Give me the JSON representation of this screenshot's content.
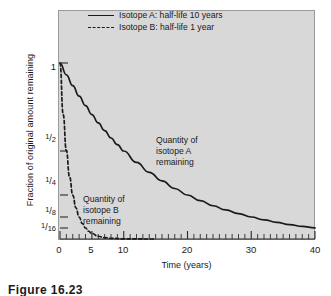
{
  "chart_data": {
    "type": "line",
    "title": "",
    "xlabel": "Time (years)",
    "ylabel": "Fraction of original amount remaining",
    "xlim": [
      0,
      40
    ],
    "ylim": [
      0,
      1
    ],
    "grid": false,
    "legend_position": "top-center",
    "x_ticks_major": [
      0,
      5,
      10,
      20,
      30,
      40
    ],
    "x_tick_labels": [
      "0",
      "5",
      "10",
      "20",
      "30",
      "40"
    ],
    "x_minor_tick_interval": 1,
    "y_ticks": [
      1,
      0.5,
      0.25,
      0.125,
      0.0625
    ],
    "y_tick_labels": [
      "1",
      "1/2",
      "1/4",
      "1/8",
      "1/16"
    ],
    "series": [
      {
        "name": "Isotope A: half-life 10 years",
        "style": "solid",
        "half_life_years": 10,
        "color": "#1a1a1a",
        "x": [
          0,
          1,
          2,
          3,
          4,
          5,
          6,
          7,
          8,
          9,
          10,
          12,
          14,
          16,
          18,
          20,
          22,
          24,
          26,
          28,
          30,
          32,
          34,
          36,
          38,
          40
        ],
        "values": [
          1.0,
          0.933,
          0.871,
          0.812,
          0.758,
          0.707,
          0.66,
          0.616,
          0.574,
          0.536,
          0.5,
          0.435,
          0.379,
          0.33,
          0.287,
          0.25,
          0.218,
          0.189,
          0.165,
          0.144,
          0.125,
          0.109,
          0.095,
          0.082,
          0.072,
          0.063
        ]
      },
      {
        "name": "Isotope B: half-life 1 year",
        "style": "dashed",
        "half_life_years": 1,
        "color": "#1a1a1a",
        "x": [
          0,
          0.5,
          1,
          1.5,
          2,
          2.5,
          3,
          3.5,
          4,
          4.5,
          5,
          6,
          7,
          8,
          10,
          12,
          14,
          15
        ],
        "values": [
          1.0,
          0.707,
          0.5,
          0.354,
          0.25,
          0.177,
          0.125,
          0.088,
          0.0625,
          0.044,
          0.031,
          0.0156,
          0.0078,
          0.0039,
          0.001,
          0.00024,
          6e-05,
          3e-05
        ]
      }
    ],
    "annotations": [
      {
        "text_lines": [
          "Quantity of",
          "isotope A",
          "remaining"
        ],
        "x": 17,
        "y": 0.47
      },
      {
        "text_lines": [
          "Quantity of",
          "isotope B",
          "remaining"
        ],
        "x": 5.5,
        "y": 0.23
      }
    ]
  },
  "legend": {
    "items": [
      {
        "label": "Isotope A: half-life 10 years",
        "style": "solid"
      },
      {
        "label": "Isotope B: half-life 1 year",
        "style": "dashed"
      }
    ]
  },
  "axes": {
    "y_title": "Fraction of original amount remaining",
    "x_title": "Time (years)",
    "y_labels": [
      {
        "whole": "1",
        "num": "",
        "den": ""
      },
      {
        "whole": "",
        "num": "1",
        "den": "2"
      },
      {
        "whole": "",
        "num": "1",
        "den": "4"
      },
      {
        "whole": "",
        "num": "1",
        "den": "8"
      },
      {
        "whole": "",
        "num": "1",
        "den": "16"
      }
    ],
    "x_labels": [
      "0",
      "5",
      "10",
      "20",
      "30",
      "40"
    ]
  },
  "annotations": {
    "isotope_a": {
      "line1": "Quantity of",
      "line2": "isotope A",
      "line3": "remaining"
    },
    "isotope_b": {
      "line1": "Quantity of",
      "line2": "isotope B",
      "line3": "remaining"
    }
  },
  "caption": {
    "text": "Figure 16.23"
  },
  "colors": {
    "plot_background": "#d8d8d8",
    "panel_border": "#9b9b9b",
    "line": "#1a1a1a",
    "page_background": "#ffffff"
  }
}
